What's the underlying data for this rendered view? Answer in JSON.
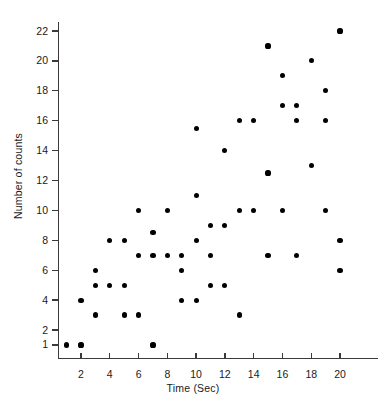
{
  "chart_data": {
    "type": "scatter",
    "title": "",
    "xlabel": "Time (Sec)",
    "ylabel": "Number of counts",
    "xlim": [
      0,
      21.5
    ],
    "ylim": [
      0,
      23
    ],
    "grid": false,
    "legend": "none",
    "marker": {
      "shape": "circle",
      "color": "#000000",
      "size": 5
    },
    "x_ticks": [
      2,
      4,
      6,
      8,
      10,
      12,
      14,
      16,
      18,
      20
    ],
    "y_ticks": [
      1,
      2,
      4,
      6,
      8,
      10,
      12,
      14,
      16,
      18,
      20,
      22
    ],
    "x_tick_labels": [
      "2",
      "4",
      "6",
      "8",
      "10",
      "12",
      "14",
      "16",
      "18",
      "20"
    ],
    "y_tick_labels": [
      "22",
      "20",
      "18",
      "16",
      "14",
      "12",
      "10",
      "8",
      "6",
      "4",
      "2",
      "1"
    ],
    "points": [
      {
        "x": 1,
        "y": 1
      },
      {
        "x": 2,
        "y": 1
      },
      {
        "x": 2,
        "y": 4
      },
      {
        "x": 3,
        "y": 3
      },
      {
        "x": 3,
        "y": 5
      },
      {
        "x": 3,
        "y": 6
      },
      {
        "x": 4,
        "y": 5
      },
      {
        "x": 4,
        "y": 8
      },
      {
        "x": 5,
        "y": 3
      },
      {
        "x": 5,
        "y": 5
      },
      {
        "x": 5,
        "y": 8
      },
      {
        "x": 6,
        "y": 3
      },
      {
        "x": 6,
        "y": 7
      },
      {
        "x": 6,
        "y": 10
      },
      {
        "x": 7,
        "y": 1
      },
      {
        "x": 7,
        "y": 7
      },
      {
        "x": 7,
        "y": 8.5
      },
      {
        "x": 8,
        "y": 7
      },
      {
        "x": 8,
        "y": 10
      },
      {
        "x": 9,
        "y": 4
      },
      {
        "x": 9,
        "y": 6
      },
      {
        "x": 9,
        "y": 7
      },
      {
        "x": 10,
        "y": 4
      },
      {
        "x": 10,
        "y": 8
      },
      {
        "x": 10,
        "y": 11
      },
      {
        "x": 10,
        "y": 15.5
      },
      {
        "x": 11,
        "y": 5
      },
      {
        "x": 11,
        "y": 7
      },
      {
        "x": 11,
        "y": 9
      },
      {
        "x": 12,
        "y": 5
      },
      {
        "x": 12,
        "y": 9
      },
      {
        "x": 12,
        "y": 14
      },
      {
        "x": 13,
        "y": 3
      },
      {
        "x": 13,
        "y": 10
      },
      {
        "x": 13,
        "y": 16
      },
      {
        "x": 14,
        "y": 10
      },
      {
        "x": 14,
        "y": 16
      },
      {
        "x": 15,
        "y": 7
      },
      {
        "x": 15,
        "y": 12.5
      },
      {
        "x": 15,
        "y": 21
      },
      {
        "x": 16,
        "y": 10
      },
      {
        "x": 16,
        "y": 17
      },
      {
        "x": 16,
        "y": 19
      },
      {
        "x": 17,
        "y": 7
      },
      {
        "x": 17,
        "y": 16
      },
      {
        "x": 17,
        "y": 17
      },
      {
        "x": 18,
        "y": 13
      },
      {
        "x": 18,
        "y": 20
      },
      {
        "x": 19,
        "y": 10
      },
      {
        "x": 19,
        "y": 16
      },
      {
        "x": 19,
        "y": 18
      },
      {
        "x": 20,
        "y": 6
      },
      {
        "x": 20,
        "y": 8
      },
      {
        "x": 20,
        "y": 22
      }
    ]
  },
  "axes": {
    "x_title": "Time (Sec)",
    "y_title": "Number of counts"
  }
}
